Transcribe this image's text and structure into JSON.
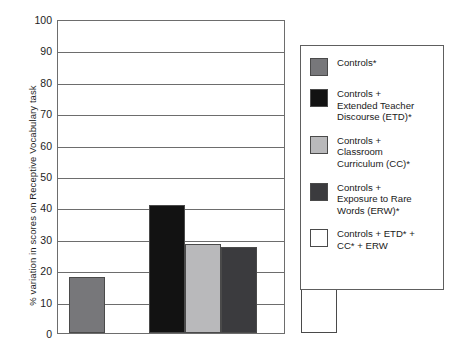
{
  "chart_data": {
    "type": "bar",
    "title": "",
    "xlabel": "",
    "ylabel": "% variation in scores on Receptive Vocabulary task",
    "ylim": [
      0,
      100
    ],
    "yticks": [
      0,
      10,
      20,
      30,
      40,
      50,
      60,
      70,
      80,
      90,
      100
    ],
    "grid": true,
    "legend_position": "right",
    "categories": [
      "Controls*",
      "Controls + Extended Teacher Discourse (ETD)*",
      "Controls + Classroom Curriculum (CC)*",
      "Controls + Exposure to Rare Words (ERW)*",
      "Controls + ETD* + CC* + ERW"
    ],
    "values": [
      18,
      41,
      28.5,
      27.5,
      49
    ],
    "colors": [
      "#77777a",
      "#121212",
      "#b9b9bb",
      "#3b3b3e",
      "#ffffff"
    ]
  },
  "axis": {
    "y_title": "% variation in scores on Receptive Vocabulary task",
    "tick_labels": [
      "100",
      "90",
      "80",
      "70",
      "60",
      "50",
      "40",
      "30",
      "20",
      "10",
      "0"
    ]
  },
  "legend": {
    "entries": [
      {
        "label": "Controls*",
        "color": "#77777a",
        "swatch_name": "legend-swatch-controls"
      },
      {
        "label": "Controls +\nExtended Teacher\nDiscourse (ETD)*",
        "color": "#121212",
        "swatch_name": "legend-swatch-etd"
      },
      {
        "label": "Controls +\nClassroom\nCurriculum (CC)*",
        "color": "#b9b9bb",
        "swatch_name": "legend-swatch-cc"
      },
      {
        "label": "Controls +\nExposure to Rare\nWords (ERW)*",
        "color": "#3b3b3e",
        "swatch_name": "legend-swatch-erw"
      },
      {
        "label": "Controls + ETD* +\nCC* + ERW",
        "color": "#ffffff",
        "swatch_name": "legend-swatch-combined"
      }
    ]
  }
}
